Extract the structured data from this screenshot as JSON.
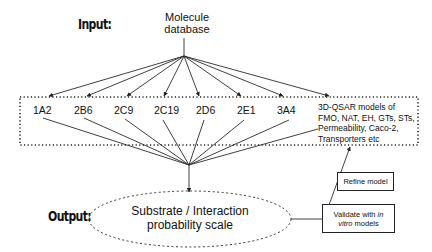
{
  "diagram": {
    "input_label": "Input:",
    "output_label": "Output:",
    "source": {
      "line1": "Molecule",
      "line2": "database"
    },
    "models": [
      {
        "label": "1A2"
      },
      {
        "label": "2B6"
      },
      {
        "label": "2C9"
      },
      {
        "label": "2C19"
      },
      {
        "label": "2D6"
      },
      {
        "label": "2E1"
      },
      {
        "label": "3A4"
      }
    ],
    "qsar_text": "3D-QSAR models of FMO, NAT, EH, GTs, STs, Permeability, Caco-2, Transporters etc",
    "output_node": {
      "line1": "Substrate / Interaction",
      "line2": "probability scale"
    },
    "refine_box": "Refine model",
    "validate_box": {
      "prefix": "Validate with ",
      "italic1": "in",
      "italic2": "vitro",
      "suffix": " models"
    },
    "colors": {
      "line": "#2a2a2a",
      "background": "#ffffff",
      "text": "#111111"
    }
  }
}
